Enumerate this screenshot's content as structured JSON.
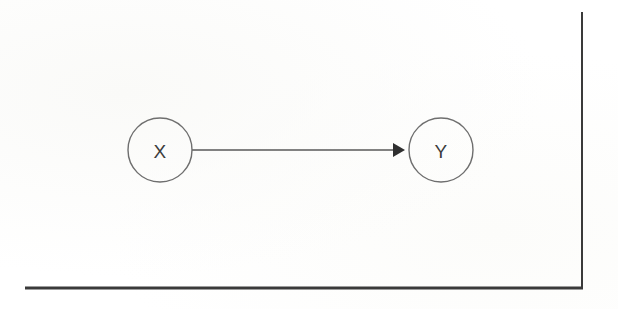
{
  "figure": {
    "title": "",
    "background_color": "#fefefe",
    "width": 618,
    "height": 309
  },
  "diagram": {
    "type": "directed-graph",
    "node_stroke_color": "#6e6e6e",
    "edge_color": "#585858",
    "arrowhead_color": "#2f2f2f",
    "label_color": "#3c3c3c",
    "nodes": [
      {
        "id": "X",
        "label": "X",
        "cx": 160,
        "cy": 150,
        "r": 32
      },
      {
        "id": "Y",
        "label": "Y",
        "cx": 441,
        "cy": 150,
        "r": 32
      }
    ],
    "edges": [
      {
        "id": "x-to-y",
        "from": "X",
        "to": "Y",
        "label": "",
        "x1": 192,
        "y1": 150,
        "x2": 405,
        "y2": 150,
        "directed": true
      }
    ]
  },
  "page_borders": {
    "color": "#3a3a3a",
    "bottom_rule": {
      "x1": 25,
      "y1": 288,
      "x2": 583,
      "y2": 288,
      "width": 3
    },
    "right_rule": {
      "x1": 582,
      "y1": 12,
      "x2": 582,
      "y2": 288,
      "width": 2
    }
  }
}
